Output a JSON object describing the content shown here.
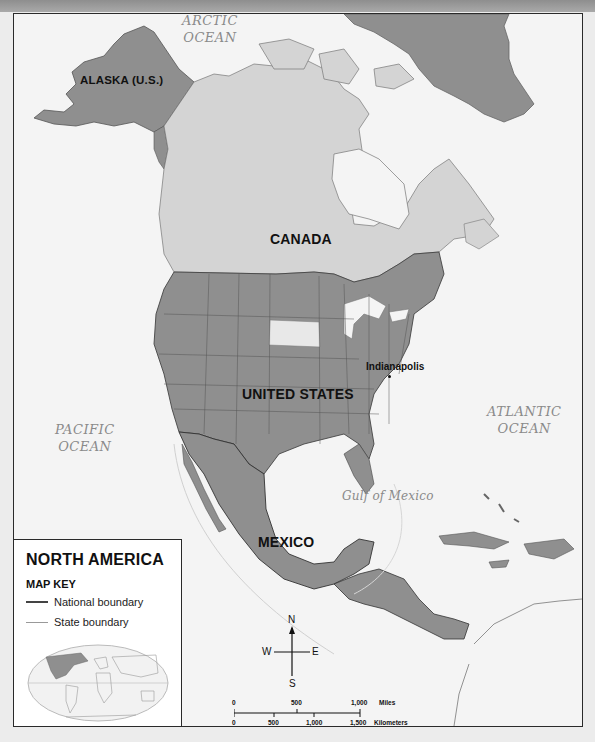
{
  "map": {
    "title": "NORTH AMERICA",
    "colors": {
      "us_mexico_alaska_greenland": "#8f8f8f",
      "canada": "#d4d4d4",
      "water": "#f4f4f4",
      "highlight_state": "#e8e8e8",
      "border_dark": "#2a2a2a"
    },
    "labels": {
      "oceans": [
        {
          "id": "arctic",
          "line1": "ARCTIC",
          "line2": "OCEAN"
        },
        {
          "id": "pacific",
          "line1": "PACIFIC",
          "line2": "OCEAN"
        },
        {
          "id": "atlantic",
          "line1": "ATLANTIC",
          "line2": "OCEAN"
        },
        {
          "id": "gulf",
          "line1": "Gulf of Mexico"
        }
      ],
      "countries": {
        "alaska": "ALASKA (U.S.)",
        "canada": "CANADA",
        "united_states": "UNITED STATES",
        "mexico": "MEXICO"
      },
      "cities": {
        "indianapolis": "Indianapolis"
      }
    }
  },
  "legend": {
    "title": "NORTH AMERICA",
    "key_heading": "MAP KEY",
    "items": [
      {
        "label": "National boundary"
      },
      {
        "label": "State boundary"
      }
    ]
  },
  "compass": {
    "n": "N",
    "s": "S",
    "e": "E",
    "w": "W"
  },
  "scale_bar": {
    "miles": {
      "ticks": [
        "0",
        "500",
        "1,000"
      ],
      "unit": "Miles"
    },
    "kilometers": {
      "ticks": [
        "0",
        "500",
        "1,000",
        "1,500"
      ],
      "unit": "Kilometers"
    }
  }
}
